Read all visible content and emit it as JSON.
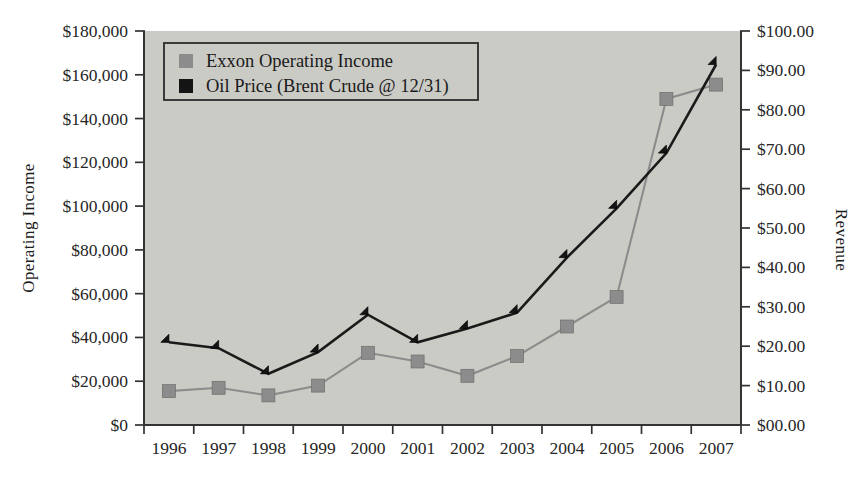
{
  "chart_data": {
    "type": "line",
    "title": "",
    "xlabel": "",
    "ylabel": "Operating Income",
    "y2label": "Revenue",
    "grid": false,
    "legend_position": "top-left-inside",
    "categories": [
      "1996",
      "1997",
      "1998",
      "1999",
      "2000",
      "2001",
      "2002",
      "2003",
      "2004",
      "2005",
      "2006",
      "2007"
    ],
    "ylim": [
      0,
      180000
    ],
    "yticks": [
      0,
      20000,
      40000,
      60000,
      80000,
      100000,
      120000,
      140000,
      160000,
      180000
    ],
    "ytick_labels": [
      "$0",
      "$20,000",
      "$40,000",
      "$60,000",
      "$80,000",
      "$100,000",
      "$120,000",
      "$140,000",
      "$160,000",
      "$180,000"
    ],
    "y2lim": [
      0,
      100
    ],
    "y2ticks": [
      0,
      10,
      20,
      30,
      40,
      50,
      60,
      70,
      80,
      90,
      100
    ],
    "y2tick_labels": [
      "$00.00",
      "$10.00",
      "$20.00",
      "$30.00",
      "$40.00",
      "$50.00",
      "$60.00",
      "$70.00",
      "$80.00",
      "$90.00",
      "$100.00"
    ],
    "series": [
      {
        "name": "Exxon Operating Income",
        "axis": "left",
        "color": "#8c8c8c",
        "marker": "square",
        "values": [
          15500,
          17000,
          13500,
          18000,
          33000,
          29000,
          22500,
          31500,
          45000,
          58500,
          149000,
          155500
        ]
      },
      {
        "name": "Oil Price (Brent Crude @ 12/31)",
        "axis": "right",
        "color": "#141414",
        "marker": "diamond",
        "values": [
          21.0,
          19.5,
          13.0,
          18.5,
          28.0,
          21.0,
          24.5,
          28.5,
          42.5,
          55.0,
          69.0,
          91.5
        ]
      }
    ]
  },
  "legend": {
    "items": [
      {
        "label": "Exxon Operating Income",
        "swatch_color": "#8c8c8c"
      },
      {
        "label": "Oil Price (Brent Crude @ 12/31)",
        "swatch_color": "#141414"
      }
    ]
  },
  "axes": {
    "left_title": "Operating Income",
    "right_title": "Revenue"
  },
  "colors": {
    "plot_background": "#cbcbc6",
    "page_background": "#ffffff",
    "axis": "#333333",
    "series_a": "#8c8c8c",
    "series_b": "#141414"
  }
}
